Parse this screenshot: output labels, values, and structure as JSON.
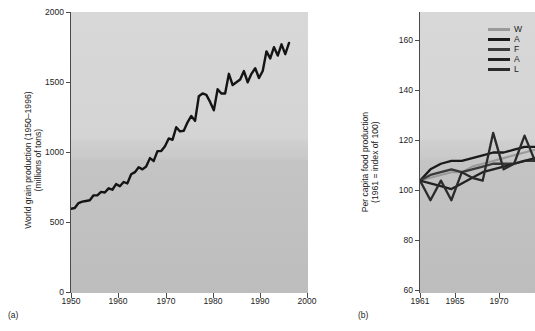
{
  "figure": {
    "background": "#ffffff",
    "plot_fill_top": "#d8d8d8",
    "plot_fill_bottom": "#bdbdbd",
    "line_color": "#141414"
  },
  "panel_a": {
    "tag": "(a)",
    "ylabel_line1": "World grain production (1950–1996)",
    "ylabel_line2": "(millions of tons)",
    "yticks": [
      "0",
      "500",
      "1000",
      "1500",
      "2000"
    ],
    "xticks": [
      "1950",
      "1960",
      "1970",
      "1980",
      "1990",
      "2000"
    ]
  },
  "panel_b": {
    "tag": "(b)",
    "ylabel_line1": "Per capita food production",
    "ylabel_line2": "(1961 = index of 100)",
    "yticks": [
      "60",
      "80",
      "100",
      "120",
      "140",
      "160"
    ],
    "xticks": [
      "1961",
      "1965",
      "1970"
    ],
    "legend": [
      {
        "label": "W",
        "color": "#9a9a9a",
        "thickness": 3
      },
      {
        "label": "A",
        "color": "#1a1a1a",
        "thickness": 3
      },
      {
        "label": "F",
        "color": "#3a3a3a",
        "thickness": 3
      },
      {
        "label": "A",
        "color": "#222222",
        "thickness": 3
      },
      {
        "label": "L",
        "color": "#2b2b2b",
        "thickness": 3
      }
    ]
  },
  "chart_data": [
    {
      "type": "line",
      "id": "panel-a",
      "title": "",
      "xlabel": "",
      "ylabel": "World grain production (1950–1996) (millions of tons)",
      "xlim": [
        1950,
        2000
      ],
      "ylim": [
        0,
        2000
      ],
      "grid": false,
      "legend": "none",
      "xticks": [
        1950,
        1960,
        1970,
        1980,
        1990,
        2000
      ],
      "yticks": [
        0,
        500,
        1000,
        1500,
        2000
      ],
      "series": [
        {
          "name": "World grain production",
          "color": "#141414",
          "x": [
            1950,
            1951,
            1952,
            1953,
            1954,
            1955,
            1956,
            1957,
            1958,
            1959,
            1960,
            1961,
            1962,
            1963,
            1964,
            1965,
            1966,
            1967,
            1968,
            1969,
            1970,
            1971,
            1972,
            1973,
            1974,
            1975,
            1976,
            1977,
            1978,
            1979,
            1980,
            1981,
            1982,
            1983,
            1984,
            1985,
            1986,
            1987,
            1988,
            1989,
            1990,
            1991,
            1992,
            1993,
            1994,
            1995,
            1996
          ],
          "values": [
            600,
            605,
            640,
            650,
            655,
            660,
            695,
            695,
            720,
            715,
            745,
            735,
            775,
            760,
            790,
            780,
            845,
            860,
            895,
            880,
            900,
            960,
            940,
            1010,
            1010,
            1045,
            1100,
            1090,
            1180,
            1150,
            1155,
            1215,
            1260,
            1225,
            1400,
            1420,
            1410,
            1360,
            1300,
            1450,
            1420,
            1420,
            1560,
            1480,
            1500,
            1520,
            1580,
            1500,
            1560,
            1600,
            1530,
            1580,
            1720,
            1670,
            1750,
            1690,
            1770,
            1700,
            1780
          ]
        }
      ]
    },
    {
      "type": "line",
      "id": "panel-b",
      "title": "",
      "xlabel": "",
      "ylabel": "Per capita food production (1961 = index of 100)",
      "xlim": [
        1961,
        1972
      ],
      "ylim": [
        60,
        160
      ],
      "grid": false,
      "legend": "upper right",
      "xticks": [
        1961,
        1965,
        1970
      ],
      "yticks": [
        60,
        80,
        100,
        120,
        140,
        160
      ],
      "series": [
        {
          "name": "W",
          "color": "#9a9a9a",
          "x": [
            1961,
            1962,
            1963,
            1964,
            1965,
            1966,
            1967,
            1968,
            1969,
            1970,
            1971,
            1972
          ],
          "values": [
            100,
            101,
            102,
            103,
            103,
            105,
            106,
            107,
            108,
            109,
            110,
            111
          ]
        },
        {
          "name": "A",
          "color": "#1a1a1a",
          "x": [
            1961,
            1962,
            1963,
            1964,
            1965,
            1966,
            1967,
            1968,
            1969,
            1970,
            1971,
            1972
          ],
          "values": [
            100,
            104,
            106,
            107,
            107,
            108,
            109,
            110,
            110,
            111,
            112,
            112
          ]
        },
        {
          "name": "F",
          "color": "#3a3a3a",
          "x": [
            1961,
            1962,
            1963,
            1964,
            1965,
            1966,
            1967,
            1968,
            1969,
            1970,
            1971,
            1972
          ],
          "values": [
            100,
            102,
            103,
            104,
            103,
            104,
            105,
            106,
            106,
            106,
            107,
            107
          ]
        },
        {
          "name": "A",
          "color": "#222222",
          "x": [
            1961,
            1962,
            1963,
            1964,
            1965,
            1966,
            1967,
            1968,
            1969,
            1970,
            1971,
            1972
          ],
          "values": [
            100,
            99,
            98,
            97,
            99,
            101,
            103,
            104,
            105,
            106,
            107,
            108
          ]
        },
        {
          "name": "L",
          "color": "#2b2b2b",
          "x": [
            1961,
            1962,
            1963,
            1964,
            1965,
            1966,
            1967,
            1968,
            1969,
            1970,
            1971,
            1972
          ],
          "values": [
            100,
            93,
            100,
            93,
            103,
            101,
            100,
            117,
            104,
            106,
            116,
            107
          ]
        }
      ]
    }
  ]
}
